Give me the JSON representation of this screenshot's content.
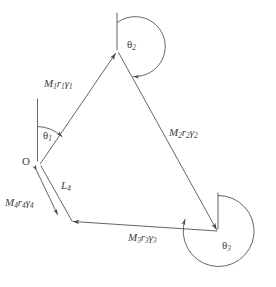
{
  "figure": {
    "type": "vector-loop-kinematic-diagram",
    "background_color": "#ffffff",
    "stroke_color": "#4a4a4a",
    "text_color": "#3f3f3f",
    "origin_label": "O",
    "links": [
      {
        "id": "link1",
        "label_M": "M",
        "sub_M": "1",
        "label_r": "r",
        "sub_r": "1",
        "label_g": "γ",
        "sub_g": "1",
        "text": "M₁r₁γ₁"
      },
      {
        "id": "link2",
        "label_M": "M",
        "sub_M": "2",
        "label_r": "r",
        "sub_r": "2",
        "label_g": "γ",
        "sub_g": "2",
        "text": "M₂r₂γ₂"
      },
      {
        "id": "link3",
        "label_M": "M",
        "sub_M": "3",
        "label_r": "r",
        "sub_r": "3",
        "label_g": "γ",
        "sub_g": "3",
        "text": "M₃r₃γ₃"
      },
      {
        "id": "link4",
        "label_M": "M",
        "sub_M": "4",
        "label_r": "r",
        "sub_r": "4",
        "label_g": "γ",
        "sub_g": "4",
        "text": "M₄r₄γ₄"
      }
    ],
    "ground_link": {
      "label": "L",
      "sub": "4",
      "text": "L₄"
    },
    "angles": [
      {
        "id": "theta1",
        "symbol": "θ",
        "sub": "1",
        "text": "θ₁",
        "vertex": "O"
      },
      {
        "id": "theta2",
        "symbol": "θ",
        "sub": "2",
        "text": "θ₂",
        "vertex": "top"
      },
      {
        "id": "theta3",
        "symbol": "θ",
        "sub": "3",
        "text": "θ₃",
        "vertex": "right"
      }
    ]
  }
}
